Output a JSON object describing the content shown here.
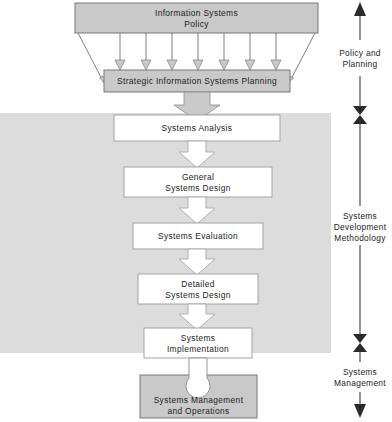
{
  "diagram": {
    "colors": {
      "shaded_band": "#dcdcdc",
      "gray_box_fill": "#c9c9c9",
      "white_box_fill": "#ffffff",
      "box_stroke": "#6e6e6e",
      "arrow_fill": "#c9c9c9",
      "axis_stroke": "#3d3d3d",
      "text": "#1b1b1b"
    },
    "policy_box": {
      "line1": "Information Systems",
      "line2": "Policy",
      "style": "gray-trapezoid-top"
    },
    "planning_box": {
      "line1": "Strategic Information Systems Planning",
      "style": "gray-rectangle"
    },
    "fan_arrows": {
      "vertical_count": 7,
      "diagonal_count": 2,
      "description": "arrows cascading from policy box down to planning box"
    },
    "process_steps": [
      {
        "id": "systems-analysis",
        "lines": [
          "Systems Analysis"
        ]
      },
      {
        "id": "general-systems-design",
        "lines": [
          "General",
          "Systems Design"
        ]
      },
      {
        "id": "systems-evaluation",
        "lines": [
          "Systems Evaluation"
        ]
      },
      {
        "id": "detailed-systems-design",
        "lines": [
          "Detailed",
          "Systems Design"
        ]
      },
      {
        "id": "systems-implementation",
        "lines": [
          "Systems",
          "Implementation"
        ]
      }
    ],
    "management_box": {
      "line1": "Systems Management",
      "line2": "and Operations",
      "style": "gray-rectangle-with-circle-notch"
    },
    "phases": [
      {
        "id": "policy-and-planning",
        "lines": [
          "Policy and",
          "Planning"
        ],
        "marker_top": "arrowhead-up",
        "marker_bottom": "bowtie"
      },
      {
        "id": "systems-development",
        "lines": [
          "Systems",
          "Development",
          "Methodology"
        ],
        "marker_top": "bowtie",
        "marker_bottom": "bowtie"
      },
      {
        "id": "systems-management",
        "lines": [
          "Systems",
          "Management"
        ],
        "marker_top": "bowtie",
        "marker_bottom": "arrowhead-down"
      }
    ]
  }
}
